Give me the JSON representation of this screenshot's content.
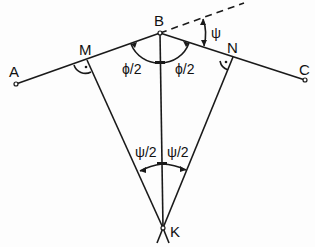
{
  "diagram": {
    "points": {
      "A": {
        "label": "A",
        "x": 16,
        "y": 84
      },
      "M": {
        "label": "M",
        "x": 87,
        "y": 60
      },
      "B": {
        "label": "B",
        "x": 160,
        "y": 33
      },
      "N": {
        "label": "N",
        "x": 233,
        "y": 57
      },
      "C": {
        "label": "C",
        "x": 305,
        "y": 80
      },
      "K": {
        "label": "K",
        "x": 163,
        "y": 228
      }
    },
    "angles": {
      "phi_half_left": "ϕ/2",
      "phi_half_right": "ϕ/2",
      "psi": "ψ",
      "psi_half_left": "ψ/2",
      "psi_half_right": "ψ/2"
    },
    "colors": {
      "stroke": "#1a1a1a",
      "background": "#fdfdfd"
    }
  }
}
